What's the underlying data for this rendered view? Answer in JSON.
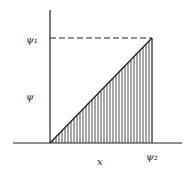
{
  "diagram": {
    "type": "shaded-triangle-plot",
    "labels": {
      "y_top_tick": "ψ₁",
      "y_axis": "ψ",
      "x_axis": "x",
      "x_right_tick": "ψ₂"
    },
    "colors": {
      "line": "#222222",
      "background": "#ffffff"
    },
    "geometry": {
      "origin": [
        50,
        143
      ],
      "y_axis_top": 10,
      "x_axis_left": 13,
      "x_axis_right": 182,
      "peak": [
        152,
        38
      ],
      "hatch_spacing": 3
    }
  }
}
